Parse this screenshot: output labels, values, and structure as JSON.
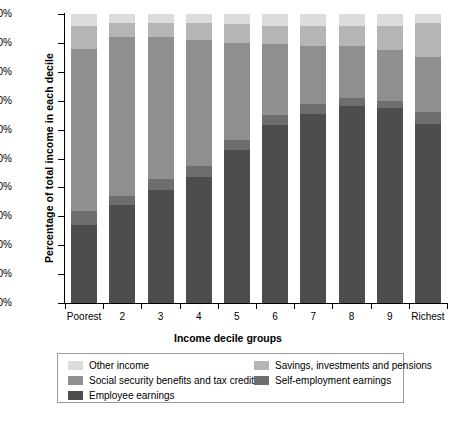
{
  "chart_data": {
    "type": "bar",
    "subtype": "stacked-bar-100",
    "title": "",
    "xlabel": "Income decile groups",
    "ylabel": "Percentage of total income in each decile",
    "ylim": [
      0,
      100
    ],
    "ytick_labels": [
      "0%",
      "10%",
      "20%",
      "30%",
      "40%",
      "50%",
      "60%",
      "70%",
      "80%",
      "90%",
      "100%"
    ],
    "ytick_values": [
      0,
      10,
      20,
      30,
      40,
      50,
      60,
      70,
      80,
      90,
      100
    ],
    "grid": false,
    "legend_position": "bottom",
    "categories": [
      "Poorest",
      "2",
      "3",
      "4",
      "5",
      "6",
      "7",
      "8",
      "9",
      "Richest"
    ],
    "series": [
      {
        "name": "Employee earnings",
        "color": "#4d4d4d",
        "values": [
          27.0,
          34.0,
          39.0,
          43.5,
          53.0,
          61.5,
          65.5,
          68.0,
          67.5,
          62.0
        ]
      },
      {
        "name": "Self-employment earnings",
        "color": "#6e6e6e",
        "values": [
          5.0,
          3.0,
          4.0,
          4.0,
          3.5,
          3.5,
          3.5,
          3.0,
          2.5,
          4.0
        ]
      },
      {
        "name": "Social security benefits and tax credits",
        "color": "#8f8f8f",
        "values": [
          56.0,
          55.0,
          49.0,
          43.5,
          33.5,
          24.5,
          20.0,
          18.0,
          17.5,
          19.0
        ]
      },
      {
        "name": "Savings, investments and pensions",
        "color": "#b5b5b5",
        "values": [
          8.0,
          5.0,
          5.0,
          6.0,
          6.5,
          6.5,
          7.0,
          7.0,
          8.5,
          12.0
        ]
      },
      {
        "name": "Other income",
        "color": "#dcdcdc",
        "values": [
          4.0,
          3.0,
          3.0,
          3.0,
          3.5,
          4.0,
          4.0,
          4.0,
          4.0,
          3.0
        ]
      }
    ]
  },
  "legend": {
    "entries": [
      {
        "label": "Other income",
        "color": "#dcdcdc"
      },
      {
        "label": "Savings, investments and pensions",
        "color": "#b5b5b5"
      },
      {
        "label": "Social security benefits and tax credits",
        "color": "#8f8f8f"
      },
      {
        "label": "Self-employment earnings",
        "color": "#6e6e6e"
      },
      {
        "label": "Employee earnings",
        "color": "#4d4d4d"
      }
    ]
  }
}
